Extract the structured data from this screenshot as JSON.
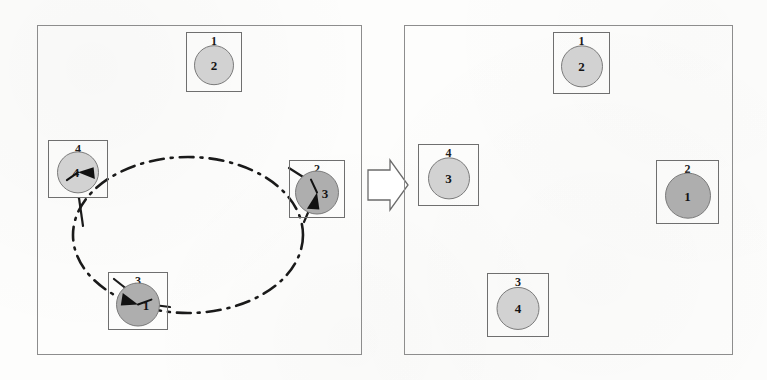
{
  "figure": {
    "background_color": "#fdfdfc",
    "panel_border_color": "#8d8d8d",
    "node_border_color": "#6f6f6f",
    "circle_fill_light": "#d2d2d2",
    "circle_fill_dark": "#aeaeae",
    "ring_color": "#1a1a1a",
    "text_color": "#141414"
  },
  "arrow": {
    "name": "transition-arrow",
    "direction": "right",
    "style": "block-outline"
  },
  "left_panel": {
    "name": "before-state-panel",
    "x": 37,
    "y": 25,
    "width": 325,
    "height": 330,
    "ring": {
      "type": "dash-dot-ellipse",
      "center_x": 188,
      "center_y": 235,
      "radius_x": 115,
      "radius_y": 78,
      "dash_pattern": "14 7 2 7"
    },
    "nodes": [
      {
        "id": "left-node-1",
        "label": "1",
        "value": "2",
        "x": 186,
        "y": 32,
        "width": 56,
        "height": 60,
        "circle_diameter": 38,
        "shade": "light",
        "has_pointer": false,
        "pointer_angle": 0,
        "text_offset": "center"
      },
      {
        "id": "left-node-4",
        "label": "4",
        "value": "4",
        "x": 48,
        "y": 140,
        "width": 60,
        "height": 58,
        "circle_diameter": 40,
        "shade": "light",
        "has_pointer": true,
        "pointer_angle": 55,
        "text_offset": "left"
      },
      {
        "id": "left-node-2",
        "label": "2",
        "value": "3",
        "x": 289,
        "y": 160,
        "width": 56,
        "height": 58,
        "circle_diameter": 42,
        "shade": "dark",
        "has_pointer": true,
        "pointer_angle": 155,
        "text_offset": "right"
      },
      {
        "id": "left-node-3",
        "label": "3",
        "value": "1",
        "x": 108,
        "y": 272,
        "width": 60,
        "height": 58,
        "circle_diameter": 42,
        "shade": "dark",
        "has_pointer": true,
        "pointer_angle": 250,
        "text_offset": "right"
      }
    ]
  },
  "right_panel": {
    "name": "after-state-panel",
    "x": 404,
    "y": 25,
    "width": 329,
    "height": 330,
    "nodes": [
      {
        "id": "right-node-1",
        "label": "1",
        "value": "2",
        "x": 553,
        "y": 32,
        "width": 57,
        "height": 62,
        "circle_diameter": 40,
        "shade": "light",
        "has_pointer": false,
        "pointer_angle": 0,
        "text_offset": "center"
      },
      {
        "id": "right-node-4",
        "label": "4",
        "value": "3",
        "x": 418,
        "y": 144,
        "width": 61,
        "height": 62,
        "circle_diameter": 40,
        "shade": "light",
        "has_pointer": false,
        "pointer_angle": 0,
        "text_offset": "center"
      },
      {
        "id": "right-node-2",
        "label": "2",
        "value": "1",
        "x": 656,
        "y": 160,
        "width": 63,
        "height": 64,
        "circle_diameter": 44,
        "shade": "dark",
        "has_pointer": false,
        "pointer_angle": 0,
        "text_offset": "center"
      },
      {
        "id": "right-node-3",
        "label": "3",
        "value": "4",
        "x": 487,
        "y": 273,
        "width": 62,
        "height": 64,
        "circle_diameter": 41,
        "shade": "light",
        "has_pointer": false,
        "pointer_angle": 0,
        "text_offset": "center"
      }
    ]
  }
}
